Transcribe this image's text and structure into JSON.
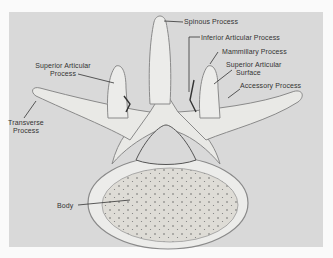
{
  "figure": {
    "labels": {
      "spinous_process": "Spinous Process",
      "inferior_articular_process": "Inferior Articular Process",
      "mammillary_process": "Mammillary Process",
      "superior_articular_surface_l1": "Superior Articular",
      "superior_articular_surface_l2": "Surface",
      "accessory_process": "Accessory Process",
      "superior_articular_process_l1": "Superior Articular",
      "superior_articular_process_l2": "Process",
      "transverse_process_l1": "Transverse",
      "transverse_process_l2": "Process",
      "body": "Body"
    },
    "colors": {
      "background": "#d9d9d9",
      "bone": "#e9e9e6",
      "bone_outline": "#8a8a8a",
      "text": "#333333",
      "leader": "#333333"
    }
  }
}
